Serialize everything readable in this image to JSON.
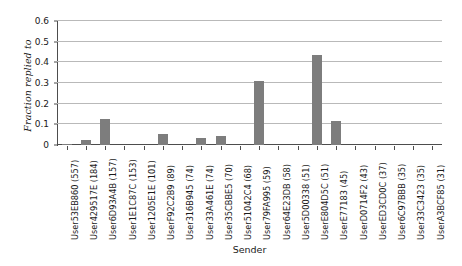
{
  "chart_data": {
    "type": "bar",
    "title": "",
    "xlabel": "Sender",
    "ylabel": "Fraction replied to",
    "ylim": [
      0,
      0.6
    ],
    "yticks": [
      0,
      0.1,
      0.2,
      0.3,
      0.4,
      0.5,
      0.6
    ],
    "ytick_labels": [
      "0",
      "0.1",
      "0.2",
      "0.3",
      "0.4",
      "0.5",
      "0.6"
    ],
    "grid": true,
    "legend": false,
    "bar_color": "#7d7d7d",
    "categories": [
      "User53EB860 (557)",
      "User429517E (184)",
      "User6D93A4B (157)",
      "User1E1C87C (153)",
      "User1205E1E (101)",
      "UserF92C2B9 (89)",
      "User316B945 (74)",
      "User33A461E (74)",
      "User35CBBE5 (70)",
      "User51042C4 (68)",
      "User79FA995 (59)",
      "User64E23DB (58)",
      "User5D00338 (51)",
      "UserE804D5C (51)",
      "UserE77183 (45)",
      "UserD0714F2 (43)",
      "UserED3CD0C (37)",
      "User6C97BBB (35)",
      "User33C3423 (35)",
      "UserA3BCF85 (31)"
    ],
    "values": [
      0.006,
      0.026,
      0.127,
      0.0,
      0.0,
      0.055,
      0.0,
      0.032,
      0.045,
      0.0,
      0.31,
      0.0,
      0.0,
      0.435,
      0.115,
      0.0,
      0.0,
      0.0,
      0.0,
      0.0
    ]
  }
}
